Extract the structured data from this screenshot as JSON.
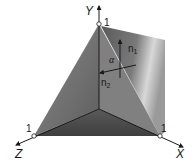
{
  "figure": {
    "type": "3d-coordinate-diagram",
    "axes": {
      "x": {
        "label": "X",
        "unit_mark": "1"
      },
      "y": {
        "label": "Y",
        "unit_mark": "1"
      },
      "z": {
        "label": "Z",
        "unit_mark": "1"
      }
    },
    "vectors": {
      "n1": {
        "label_base": "n",
        "label_sub": "1"
      },
      "n2": {
        "label_base": "n",
        "label_sub": "2"
      }
    },
    "angle": {
      "label": "α"
    },
    "colors": {
      "plane_dark": "#4a4a4a",
      "plane_mid": "#6e6e6e",
      "plane_light": "#e6e6e6",
      "axis": "#1a1a1a",
      "background": "#ffffff"
    }
  }
}
